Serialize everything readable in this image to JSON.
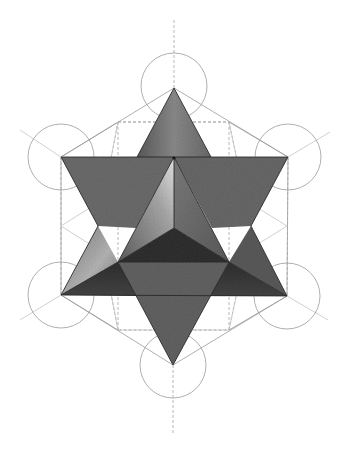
{
  "illustration": {
    "subject": "star tetrahedron (merkaba) over Metatron's cube",
    "colors": {
      "background": "#ffffff",
      "guide_line": "#9a9a9a",
      "face_mid": "#6e6e6e",
      "face_dark": "#3a3a3a",
      "face_light": "#cfcfcf",
      "edge": "#2a2a2a"
    },
    "points": {
      "center": [
        174,
        158
      ],
      "top_apex": [
        174,
        88
      ],
      "bottom_apex": [
        173,
        365
      ],
      "upper_left": [
        61,
        157
      ],
      "upper_right": [
        288,
        157
      ],
      "lower_left": [
        61,
        295
      ],
      "lower_right": [
        287,
        296
      ],
      "inner_y": [
        174,
        228
      ],
      "notch_left": [
        98,
        226
      ],
      "notch_right": [
        251,
        226
      ]
    },
    "circles": [
      {
        "cx": 174,
        "cy": 86,
        "r": 33
      },
      {
        "cx": 61,
        "cy": 157,
        "r": 33
      },
      {
        "cx": 288,
        "cy": 157,
        "r": 33
      },
      {
        "cx": 61,
        "cy": 295,
        "r": 33
      },
      {
        "cx": 287,
        "cy": 296,
        "r": 33
      },
      {
        "cx": 173,
        "cy": 365,
        "r": 33
      }
    ]
  }
}
